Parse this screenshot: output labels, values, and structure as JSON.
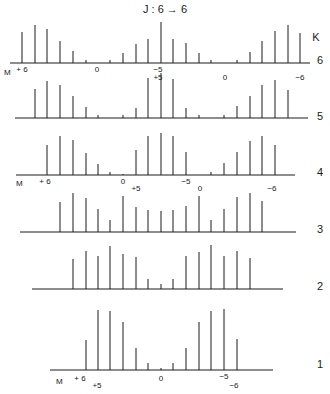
{
  "title": "J : 6 → 6",
  "axis_label_k": "K",
  "axis_label_m": "M",
  "line_color": "#1a1a1a",
  "chart_data": {
    "type": "stick-spectrum",
    "title": "J : 6 → 6",
    "ylabel": "K",
    "xlabel": "M",
    "rows": [
      {
        "k": "6",
        "baseline_y": 63,
        "x_start": 10,
        "x_end": 310,
        "label_y": 64,
        "sticks": [
          [
            22,
            31
          ],
          [
            35,
            38
          ],
          [
            47,
            34
          ],
          [
            60,
            22
          ],
          [
            73,
            12
          ],
          [
            86,
            3
          ],
          [
            110,
            3
          ],
          [
            123,
            10
          ],
          [
            136,
            19
          ],
          [
            148,
            24
          ],
          [
            161,
            41
          ],
          [
            173,
            24
          ],
          [
            186,
            20
          ],
          [
            199,
            10
          ],
          [
            211,
            3
          ],
          [
            237,
            3
          ],
          [
            250,
            11
          ],
          [
            262,
            22
          ],
          [
            275,
            32
          ],
          [
            288,
            38
          ],
          [
            300,
            30
          ]
        ],
        "ticks": [
          {
            "x": 22,
            "y": 72,
            "text": "+ 6"
          },
          {
            "x": 97,
            "y": 72,
            "text": "0"
          },
          {
            "x": 158,
            "y": 72,
            "text": "−5"
          },
          {
            "x": 158,
            "y": 80,
            "text": "+5"
          },
          {
            "x": 225,
            "y": 80,
            "text": "0"
          },
          {
            "x": 300,
            "y": 80,
            "text": "−6"
          }
        ],
        "m_label": {
          "x": 4,
          "y": 75
        }
      },
      {
        "k": "5",
        "baseline_y": 118,
        "x_start": 15,
        "x_end": 308,
        "label_y": 120,
        "sticks": [
          [
            35,
            29
          ],
          [
            47,
            37
          ],
          [
            60,
            33
          ],
          [
            73,
            22
          ],
          [
            86,
            11
          ],
          [
            98,
            3
          ],
          [
            123,
            3
          ],
          [
            136,
            10
          ],
          [
            148,
            40
          ],
          [
            161,
            45
          ],
          [
            173,
            39
          ],
          [
            186,
            10
          ],
          [
            199,
            3
          ],
          [
            224,
            3
          ],
          [
            237,
            12
          ],
          [
            250,
            22
          ],
          [
            262,
            33
          ],
          [
            275,
            38
          ],
          [
            288,
            28
          ]
        ],
        "ticks": []
      },
      {
        "k": "4",
        "baseline_y": 175,
        "x_start": 16,
        "x_end": 295,
        "label_y": 176,
        "sticks": [
          [
            47,
            30
          ],
          [
            60,
            39
          ],
          [
            73,
            35
          ],
          [
            86,
            22
          ],
          [
            98,
            11
          ],
          [
            110,
            3
          ],
          [
            123,
            1
          ],
          [
            136,
            25
          ],
          [
            148,
            39
          ],
          [
            161,
            42
          ],
          [
            173,
            39
          ],
          [
            186,
            23
          ],
          [
            211,
            3
          ],
          [
            224,
            12
          ],
          [
            237,
            23
          ],
          [
            250,
            34
          ],
          [
            262,
            39
          ],
          [
            275,
            30
          ]
        ],
        "ticks": [
          {
            "x": 45,
            "y": 184,
            "text": "+ 6"
          },
          {
            "x": 123,
            "y": 184,
            "text": "0"
          },
          {
            "x": 186,
            "y": 184,
            "text": "−5"
          },
          {
            "x": 136,
            "y": 191,
            "text": "+5"
          },
          {
            "x": 200,
            "y": 191,
            "text": "0"
          },
          {
            "x": 272,
            "y": 191,
            "text": "−6"
          }
        ],
        "m_label": {
          "x": 16,
          "y": 186
        }
      },
      {
        "k": "3",
        "baseline_y": 232,
        "x_start": 20,
        "x_end": 296,
        "label_y": 233,
        "sticks": [
          [
            60,
            30
          ],
          [
            73,
            39
          ],
          [
            86,
            34
          ],
          [
            98,
            23
          ],
          [
            110,
            12
          ],
          [
            123,
            36
          ],
          [
            136,
            25
          ],
          [
            148,
            22
          ],
          [
            161,
            21
          ],
          [
            173,
            22
          ],
          [
            186,
            26
          ],
          [
            199,
            36
          ],
          [
            211,
            12
          ],
          [
            224,
            23
          ],
          [
            237,
            35
          ],
          [
            250,
            39
          ],
          [
            262,
            31
          ]
        ],
        "ticks": []
      },
      {
        "k": "2",
        "baseline_y": 289,
        "x_start": 32,
        "x_end": 283,
        "label_y": 290,
        "sticks": [
          [
            73,
            30
          ],
          [
            86,
            38
          ],
          [
            98,
            33
          ],
          [
            110,
            43
          ],
          [
            123,
            35
          ],
          [
            136,
            32
          ],
          [
            148,
            10
          ],
          [
            161,
            5
          ],
          [
            173,
            10
          ],
          [
            186,
            33
          ],
          [
            199,
            37
          ],
          [
            211,
            44
          ],
          [
            224,
            33
          ],
          [
            237,
            38
          ],
          [
            250,
            31
          ]
        ],
        "ticks": []
      },
      {
        "k": "1",
        "baseline_y": 370,
        "x_start": 50,
        "x_end": 273,
        "label_y": 368,
        "sticks": [
          [
            86,
            30
          ],
          [
            98,
            60
          ],
          [
            110,
            59
          ],
          [
            123,
            48
          ],
          [
            136,
            22
          ],
          [
            148,
            7
          ],
          [
            161,
            2
          ],
          [
            173,
            7
          ],
          [
            186,
            22
          ],
          [
            199,
            48
          ],
          [
            211,
            59
          ],
          [
            224,
            61
          ],
          [
            237,
            31
          ]
        ],
        "ticks": [
          {
            "x": 80,
            "y": 381,
            "text": "+ 6"
          },
          {
            "x": 161,
            "y": 381,
            "text": "0"
          },
          {
            "x": 224,
            "y": 379,
            "text": "−5"
          },
          {
            "x": 97,
            "y": 388,
            "text": "+5"
          },
          {
            "x": 234,
            "y": 388,
            "text": "−6"
          }
        ],
        "m_label": {
          "x": 56,
          "y": 384
        }
      }
    ]
  }
}
